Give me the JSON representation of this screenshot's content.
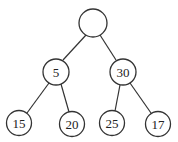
{
  "diagram": {
    "type": "binary-tree",
    "nodes": [
      {
        "id": "root",
        "label": "",
        "x": 93,
        "y": 23,
        "r": 14
      },
      {
        "id": "n5",
        "label": "5",
        "x": 56,
        "y": 72,
        "r": 13
      },
      {
        "id": "n30",
        "label": "30",
        "x": 123,
        "y": 72,
        "r": 13
      },
      {
        "id": "n15",
        "label": "15",
        "x": 19,
        "y": 123,
        "r": 12.5
      },
      {
        "id": "n20",
        "label": "20",
        "x": 72,
        "y": 124,
        "r": 12.5
      },
      {
        "id": "n25",
        "label": "25",
        "x": 112,
        "y": 123,
        "r": 12.5
      },
      {
        "id": "n17",
        "label": "17",
        "x": 158,
        "y": 124,
        "r": 12.5
      }
    ],
    "edges": [
      {
        "from": "root",
        "to": "n5"
      },
      {
        "from": "root",
        "to": "n30"
      },
      {
        "from": "n5",
        "to": "n15"
      },
      {
        "from": "n5",
        "to": "n20"
      },
      {
        "from": "n30",
        "to": "n25"
      },
      {
        "from": "n30",
        "to": "n17"
      }
    ],
    "colors": {
      "stroke": "#333333",
      "fill": "#ffffff",
      "text": "#222222"
    }
  }
}
